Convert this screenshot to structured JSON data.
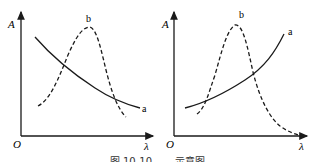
{
  "figure": {
    "panels": [
      {
        "id": "left",
        "y_axis_label": "A",
        "x_axis_label": "λ",
        "origin_label": "O",
        "curves": [
          {
            "name": "a",
            "style": "solid",
            "trend": "decreasing"
          },
          {
            "name": "b",
            "style": "dashed",
            "trend": "peak"
          }
        ]
      },
      {
        "id": "right",
        "y_axis_label": "A",
        "x_axis_label": "λ",
        "origin_label": "O",
        "curves": [
          {
            "name": "a",
            "style": "solid",
            "trend": "increasing"
          },
          {
            "name": "b",
            "style": "dashed",
            "trend": "peak"
          }
        ]
      }
    ],
    "caption": "图 10-10 ……示意图"
  }
}
